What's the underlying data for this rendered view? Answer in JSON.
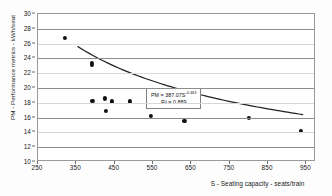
{
  "chart_data": {
    "type": "scatter",
    "title": "",
    "xlabel": "S - Seating capacity - seats/train",
    "ylabel": "PM - Performance metrics - kWh/seat",
    "xlim": [
      250,
      975
    ],
    "ylim": [
      10,
      30
    ],
    "xticks": [
      250,
      350,
      450,
      550,
      650,
      750,
      850,
      950
    ],
    "yticks": [
      10,
      12,
      14,
      16,
      18,
      20,
      22,
      24,
      26,
      28,
      30
    ],
    "grid": "horizontal",
    "legend": "none",
    "marker_color": "#111111",
    "trend_color": "#222222",
    "series": [
      {
        "name": "Observations",
        "points": [
          {
            "x": 320,
            "y": 26.8
          },
          {
            "x": 390,
            "y": 23.4
          },
          {
            "x": 390,
            "y": 23.1
          },
          {
            "x": 392,
            "y": 18.3
          },
          {
            "x": 425,
            "y": 18.6
          },
          {
            "x": 428,
            "y": 16.9
          },
          {
            "x": 443,
            "y": 18.2
          },
          {
            "x": 490,
            "y": 18.2
          },
          {
            "x": 545,
            "y": 16.2
          },
          {
            "x": 632,
            "y": 15.5
          },
          {
            "x": 800,
            "y": 16.0
          },
          {
            "x": 935,
            "y": 14.2
          }
        ]
      }
    ],
    "trendline": {
      "type": "power",
      "coefficient": 387.07,
      "exponent": -0.463,
      "x_start": 355,
      "x_end": 945
    },
    "annotation": {
      "equation": "PM = 387.07S",
      "exponent": "-0.463",
      "r_squared": "R² = 0.889"
    }
  }
}
